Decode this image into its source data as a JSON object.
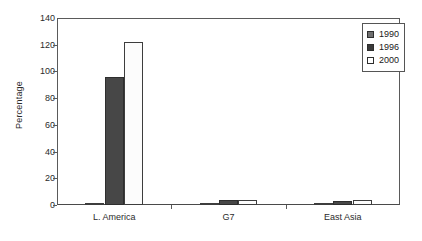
{
  "chart_data": {
    "type": "bar",
    "title": "",
    "xlabel": "",
    "ylabel": "Percentage",
    "categories": [
      "L. America",
      "G7",
      "East Asia"
    ],
    "ylim": [
      0,
      140
    ],
    "yticks": [
      0,
      20,
      40,
      60,
      80,
      100,
      120,
      140
    ],
    "ytick_labels": [
      "0",
      "20",
      "40",
      "60",
      "80",
      "100",
      "120",
      "140"
    ],
    "grid": false,
    "legend_position": "top-right",
    "series": [
      {
        "name": "1990",
        "color": "#6f6f6f",
        "values": [
          1,
          0.5,
          0.5
        ]
      },
      {
        "name": "1996",
        "color": "#474747",
        "values": [
          96,
          4,
          3
        ]
      },
      {
        "name": "2000",
        "color": "#ffffff",
        "values": [
          122,
          4,
          4
        ]
      }
    ]
  },
  "legend": {
    "items": [
      {
        "label": "1990",
        "swatch": "legend-swatch-1990"
      },
      {
        "label": "1996",
        "swatch": "legend-swatch-1996"
      },
      {
        "label": "2000",
        "swatch": "legend-swatch-2000"
      }
    ]
  },
  "axes": {
    "y_title": "Percentage",
    "y_labels": [
      "140",
      "120",
      "100",
      "80",
      "60",
      "40",
      "20",
      "0"
    ],
    "x_labels": [
      "L. America",
      "G7",
      "East Asia"
    ]
  }
}
